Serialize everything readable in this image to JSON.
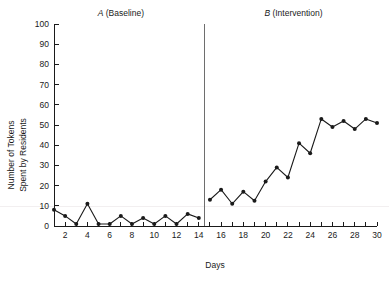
{
  "chart_data": {
    "type": "line",
    "title": "",
    "xlabel": "Days",
    "ylabel": "Number of Tokens\nSpent by Residents",
    "ylabel_line1": "Number of Tokens",
    "ylabel_line2": "Spent by Residents",
    "xlim": [
      1,
      30
    ],
    "ylim": [
      0,
      100
    ],
    "ytick_values": [
      0,
      10,
      20,
      30,
      40,
      50,
      60,
      70,
      80,
      90,
      100
    ],
    "ytick_labels": [
      "0",
      "10",
      "20",
      "30",
      "40",
      "50",
      "60",
      "70",
      "80",
      "90",
      "100"
    ],
    "xtick_values": [
      2,
      4,
      6,
      8,
      10,
      12,
      14,
      16,
      18,
      20,
      22,
      24,
      26,
      28,
      30
    ],
    "xtick_labels": [
      "2",
      "4",
      "6",
      "8",
      "10",
      "12",
      "14",
      "16",
      "18",
      "20",
      "22",
      "24",
      "26",
      "28",
      "30"
    ],
    "xtick_minor_values": [
      1,
      3,
      5,
      7,
      9,
      11,
      13,
      15,
      17,
      19,
      21,
      23,
      25,
      27,
      29
    ],
    "grid": false,
    "legend": false,
    "marker": "filled-circle",
    "line_color": "#1a1a1a",
    "marker_color": "#1a1a1a",
    "phase_divider_x": 14.5,
    "phase_divider_color": "#6e6e6e",
    "x": [
      1,
      2,
      3,
      4,
      5,
      6,
      7,
      8,
      9,
      10,
      11,
      12,
      13,
      14,
      15,
      16,
      17,
      18,
      19,
      20,
      21,
      22,
      23,
      24,
      25,
      26,
      27,
      28,
      29,
      30
    ],
    "series": [
      {
        "name": "A (Baseline)",
        "phase": "A",
        "x": [
          1,
          2,
          3,
          4,
          5,
          6,
          7,
          8,
          9,
          10,
          11,
          12,
          13,
          14
        ],
        "values": [
          8,
          5,
          1,
          11,
          1,
          1,
          5,
          1,
          4,
          1,
          5,
          1,
          6,
          4
        ]
      },
      {
        "name": "B (Intervention)",
        "phase": "B",
        "x": [
          15,
          16,
          17,
          18,
          19,
          20,
          21,
          22,
          23,
          24,
          25,
          26,
          27,
          28,
          29,
          30
        ],
        "values": [
          13,
          18,
          11,
          17,
          12.5,
          22,
          29,
          24,
          41,
          36,
          53,
          49,
          52,
          48,
          53,
          51
        ]
      }
    ],
    "annotations": [
      {
        "name": "phase-a-label",
        "letter": "A",
        "text": " (Baseline)",
        "full": "A (Baseline)",
        "x": 7.0
      },
      {
        "name": "phase-b-label",
        "letter": "B",
        "text": " (Intervention)",
        "full": "B (Intervention)",
        "x": 22.5
      }
    ]
  }
}
